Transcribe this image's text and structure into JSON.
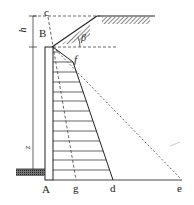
{
  "figure": {
    "type": "retaining wall earth pressure diagram",
    "labels": {
      "c": "c",
      "B": "B",
      "beta": "β",
      "h": "h",
      "z": "z",
      "f": "f",
      "A": "A",
      "g": "g",
      "d": "d",
      "e": "e"
    },
    "colors": {
      "line": "#222222",
      "dashed": "#444444",
      "hatch": "#333333",
      "background": "#ffffff"
    }
  }
}
